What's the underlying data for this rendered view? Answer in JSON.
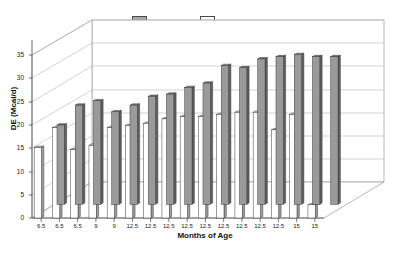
{
  "chart_data": {
    "type": "bar",
    "title": "",
    "xlabel": "Months of Age",
    "ylabel": "DE (Mcal/d)",
    "ylim": [
      0,
      37
    ],
    "yticks": [
      0,
      5,
      10,
      15,
      20,
      25,
      30,
      35
    ],
    "grid": true,
    "legend_position": "top-center",
    "threed": true,
    "categories": [
      "6.5",
      "6.5",
      "6.5",
      "9",
      "9",
      "12.5",
      "12.5",
      "12.5",
      "12.5",
      "12.5",
      "12.5",
      "12.5",
      "12.5",
      "12.5",
      "15",
      "15"
    ],
    "series": [
      {
        "name": "predicted",
        "color": "#9a9a9a",
        "values": [
          18.0,
          22.5,
          23.5,
          21.0,
          22.5,
          24.5,
          25.0,
          26.5,
          27.5,
          31.5,
          31.0,
          33.0,
          33.5,
          34.0,
          33.5,
          33.5
        ]
      },
      {
        "name": "actual",
        "color": "#ffffff",
        "values": [
          16.0,
          20.5,
          15.5,
          16.5,
          20.5,
          21.0,
          21.5,
          22.5,
          23.0,
          23.0,
          23.5,
          24.0,
          24.0,
          20.0,
          23.5,
          3.0
        ]
      }
    ]
  },
  "legend": {
    "predicted_label": "predicted",
    "actual_label": "actual"
  },
  "axes": {
    "y_title": "DE (Mcal/d)",
    "x_title": "Months of Age",
    "y_ticks": [
      "0",
      "5",
      "10",
      "15",
      "20",
      "25",
      "30",
      "35"
    ],
    "x_ticks": [
      "6.5",
      "6.5",
      "6.5",
      "9",
      "9",
      "12.5",
      "12.5",
      "12.5",
      "12.5",
      "12.5",
      "12.5",
      "12.5",
      "12.5",
      "12.5",
      "15",
      "15"
    ]
  }
}
